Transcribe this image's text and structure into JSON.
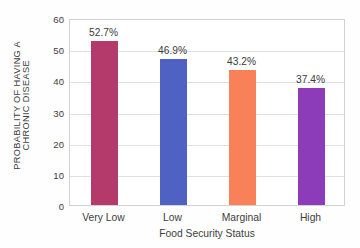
{
  "chart_data": {
    "type": "bar",
    "title": "",
    "subtitle": "",
    "xlabel": "Food Security Status",
    "ylabel": "PROBABILITY OF HAVING A CHRONIC DISEASE",
    "ylabel_lines": [
      "PROBABILITY OF HAVING A",
      "CHRONIC DISEASE"
    ],
    "categories": [
      "Very Low",
      "Low",
      "Marginal",
      "High"
    ],
    "values": [
      52.7,
      46.9,
      43.2,
      37.4
    ],
    "value_labels": [
      "52.7%",
      "46.9%",
      "43.2%",
      "37.4%"
    ],
    "bar_colors": [
      "#b33a6b",
      "#4f62c4",
      "#f8815a",
      "#8c3cb8"
    ],
    "ylim": [
      0,
      60
    ],
    "ytick_values": [
      0,
      10,
      20,
      30,
      40,
      50,
      60
    ],
    "ytick_labels": [
      "0",
      "10",
      "20",
      "30",
      "40",
      "50",
      "60"
    ],
    "grid": true,
    "grid_axis": "y",
    "legend": false,
    "legend_position": "none",
    "units": "percent",
    "background_color": "#ffffff",
    "axis_color": "#d2d2d2",
    "gridline_color": "#e0e0e0",
    "text_color": "#3d3d3d"
  }
}
